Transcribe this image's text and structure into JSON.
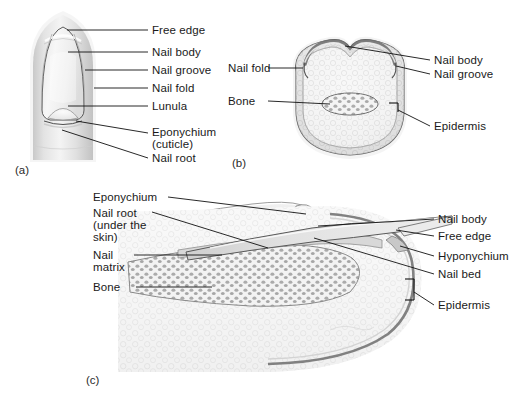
{
  "figure": {
    "background_color": "#ffffff",
    "ink_color": "#1a1a1a",
    "line_color": "#111111"
  },
  "panels": [
    {
      "id": "a",
      "letter": "(a)",
      "caption": "Surface view of fingertip and nail",
      "labels": [
        {
          "name": "free-edge",
          "text": "Free edge"
        },
        {
          "name": "nail-body",
          "text": "Nail body"
        },
        {
          "name": "nail-groove",
          "text": "Nail groove"
        },
        {
          "name": "nail-fold",
          "text": "Nail fold"
        },
        {
          "name": "lunula",
          "text": "Lunula"
        },
        {
          "name": "eponychium",
          "text": "Eponychium"
        },
        {
          "name": "eponychium-cuticle",
          "text": "(cuticle)"
        },
        {
          "name": "nail-root",
          "text": "Nail root"
        }
      ]
    },
    {
      "id": "b",
      "letter": "(b)",
      "caption": "Cross section through fingertip",
      "labels": [
        {
          "name": "nail-fold",
          "text": "Nail fold"
        },
        {
          "name": "bone",
          "text": "Bone"
        },
        {
          "name": "nail-body",
          "text": "Nail body"
        },
        {
          "name": "nail-groove",
          "text": "Nail groove"
        },
        {
          "name": "epidermis",
          "text": "Epidermis"
        }
      ]
    },
    {
      "id": "c",
      "letter": "(c)",
      "caption": "Longitudinal section through fingertip",
      "labels": [
        {
          "name": "eponychium",
          "text": "Eponychium"
        },
        {
          "name": "nail-root",
          "text": "Nail root"
        },
        {
          "name": "nail-root-line2",
          "text": "(under the"
        },
        {
          "name": "nail-root-line3",
          "text": "skin)"
        },
        {
          "name": "nail-matrix",
          "text": "Nail"
        },
        {
          "name": "nail-matrix-line2",
          "text": "matrix"
        },
        {
          "name": "bone",
          "text": "Bone"
        },
        {
          "name": "nail-body",
          "text": "Nail body"
        },
        {
          "name": "free-edge",
          "text": "Free edge"
        },
        {
          "name": "hyponychium",
          "text": "Hyponychium"
        },
        {
          "name": "nail-bed",
          "text": "Nail bed"
        },
        {
          "name": "epidermis",
          "text": "Epidermis"
        }
      ]
    }
  ]
}
